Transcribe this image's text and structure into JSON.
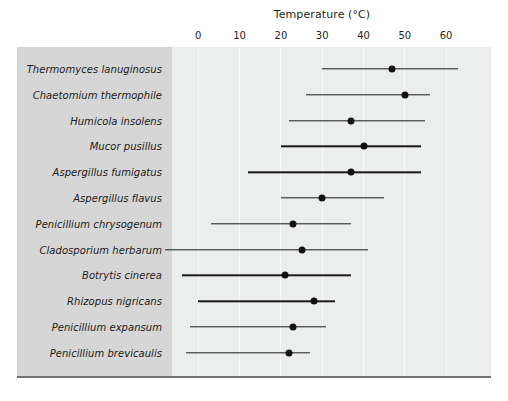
{
  "chart_data": {
    "type": "range-dot-plot",
    "title": "Temperature (°C)",
    "xlabel": "Temperature (°C)",
    "ylabel": "",
    "xlim": [
      -12,
      67
    ],
    "xticks": [
      0,
      10,
      20,
      30,
      40,
      50,
      60
    ],
    "xtick_labels": [
      "0",
      "10",
      "20",
      "30",
      "40",
      "50",
      "60"
    ],
    "grid": true,
    "legend": "none",
    "value_keys": [
      "min",
      "optimum",
      "max"
    ],
    "categories": [
      "Thermomyces lanuginosus",
      "Chaetomium thermophile",
      "Humicola insolens",
      "Mucor pusillus",
      "Aspergillus fumigatus",
      "Aspergillus flavus",
      "Penicillium chrysogenum",
      "Cladosporium herbarum",
      "Botrytis cinerea",
      "Rhizopus nigricans",
      "Penicillium expansum",
      "Penicillium brevicaulis"
    ],
    "rows": [
      {
        "name": "Thermomyces lanuginosus",
        "min": 30,
        "optimum": 47,
        "max": 63
      },
      {
        "name": "Chaetomium thermophile",
        "min": 26,
        "optimum": 50,
        "max": 56
      },
      {
        "name": "Humicola insolens",
        "min": 22,
        "optimum": 37,
        "max": 55
      },
      {
        "name": "Mucor pusillus",
        "min": 20,
        "optimum": 40,
        "max": 54
      },
      {
        "name": "Aspergillus fumigatus",
        "min": 12,
        "optimum": 37,
        "max": 54
      },
      {
        "name": "Aspergillus flavus",
        "min": 20,
        "optimum": 30,
        "max": 45
      },
      {
        "name": "Penicillium chrysogenum",
        "min": 3,
        "optimum": 23,
        "max": 37
      },
      {
        "name": "Cladosporium herbarum",
        "min": -8,
        "optimum": 25,
        "max": 41
      },
      {
        "name": "Botrytis cinerea",
        "min": -4,
        "optimum": 21,
        "max": 37
      },
      {
        "name": "Rhizopus nigricans",
        "min": 0,
        "optimum": 28,
        "max": 33
      },
      {
        "name": "Penicillium expansum",
        "min": -2,
        "optimum": 23,
        "max": 31
      },
      {
        "name": "Penicillium brevicaulis",
        "min": -3,
        "optimum": 22,
        "max": 27
      }
    ]
  },
  "colors": {
    "panel_left": "#d6d6d6",
    "panel_right": "#eceded",
    "gridline": "#f7f8f8",
    "marker": "#111111",
    "line": "#1a1a1a",
    "text": "#231f20",
    "baseline": "#6f7271"
  }
}
